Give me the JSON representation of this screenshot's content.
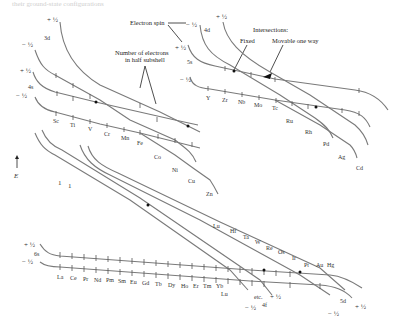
{
  "caption": "their ground-state configurations",
  "axis": {
    "label": "E",
    "arrow": "up-arrow"
  },
  "spins": {
    "plus": "+ ½",
    "minus": "− ½"
  },
  "subshells": {
    "s3d": "3d",
    "s4s": "4s",
    "s4d": "4d",
    "s5s": "5s",
    "s6s": "6s",
    "s4f": "4f",
    "s5d": "5d",
    "etc": "etc."
  },
  "annotations": {
    "electron_spin": "Electron spin",
    "num_electrons_line1": "Number of electrons",
    "num_electrons_line2": "in half subshell",
    "intersections": "Intersections:",
    "fixed": "Fixed",
    "movable": "Movable one way"
  },
  "elements": {
    "period4": [
      "Sc",
      "Ti",
      "V",
      "Cr",
      "Mn",
      "Fe",
      "Co",
      "Ni",
      "Cu",
      "Zn"
    ],
    "period5": [
      "Y",
      "Zr",
      "Nb",
      "Mo",
      "Tc",
      "Ru",
      "Rh",
      "Pd",
      "Ag",
      "Cd"
    ],
    "lanthanides": [
      "La",
      "Ce",
      "Pr",
      "Nd",
      "Pm",
      "Sm",
      "Eu",
      "Gd",
      "Tb",
      "Dy",
      "Ho",
      "Er",
      "Tm",
      "Yb",
      "Lu"
    ],
    "period6d": [
      "Lu",
      "Hf",
      "Ta",
      "W",
      "Re",
      "Os",
      "Ir",
      "Pt",
      "Au",
      "Hg"
    ]
  },
  "counts": {
    "one": "1",
    "two": "2",
    "five": "5",
    "seven": "7"
  }
}
